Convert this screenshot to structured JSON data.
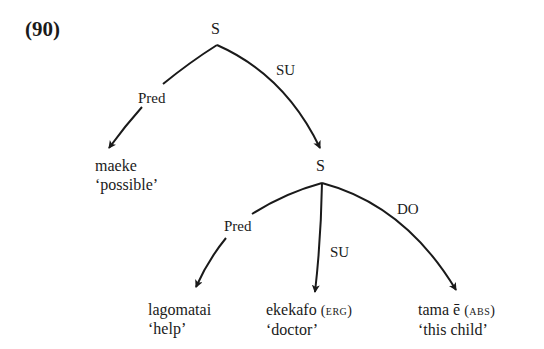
{
  "example": {
    "number": "(90)"
  },
  "tree": {
    "root": {
      "label": "S",
      "edges": {
        "pred": "Pred",
        "su": "SU"
      },
      "pred_leaf": {
        "word": "maeke",
        "gloss": "‘possible’"
      }
    },
    "embedded": {
      "label": "S",
      "edges": {
        "pred": "Pred",
        "su": "SU",
        "do": "DO"
      },
      "leaves": [
        {
          "word": "lagomatai",
          "case": "",
          "gloss": "‘help’"
        },
        {
          "word": "ekekafo",
          "case": "(erg)",
          "gloss": "‘doctor’"
        },
        {
          "word": "tama ē",
          "case": "(abs)",
          "gloss": "‘this child’"
        }
      ]
    }
  },
  "colors": {
    "ink": "#1a1a1a",
    "background": "#ffffff"
  }
}
